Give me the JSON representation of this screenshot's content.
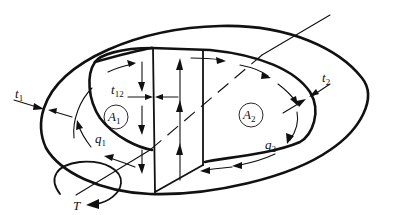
{
  "figure": {
    "labels": {
      "t1": {
        "main": "t",
        "sub": "1"
      },
      "t12": {
        "main": "t",
        "sub": "12"
      },
      "t2": {
        "main": "t",
        "sub": "2"
      },
      "A1": {
        "main": "A",
        "sub": "1"
      },
      "A2": {
        "main": "A",
        "sub": "2"
      },
      "q1": {
        "main": "q",
        "sub": "1"
      },
      "q2": {
        "main": "q",
        "sub": "2"
      },
      "T": {
        "main": "T"
      }
    }
  }
}
